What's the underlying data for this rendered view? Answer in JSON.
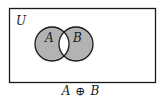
{
  "diagram": {
    "type": "venn",
    "universe_label": "U",
    "sets": [
      {
        "label": "A"
      },
      {
        "label": "B"
      }
    ],
    "shaded_region": "symmetric difference",
    "caption": {
      "left": "A",
      "operator": "⊕",
      "right": "B"
    },
    "colors": {
      "shade": "#b3b3b3",
      "stroke": "#1a1a1a",
      "background": "#ffffff"
    }
  }
}
